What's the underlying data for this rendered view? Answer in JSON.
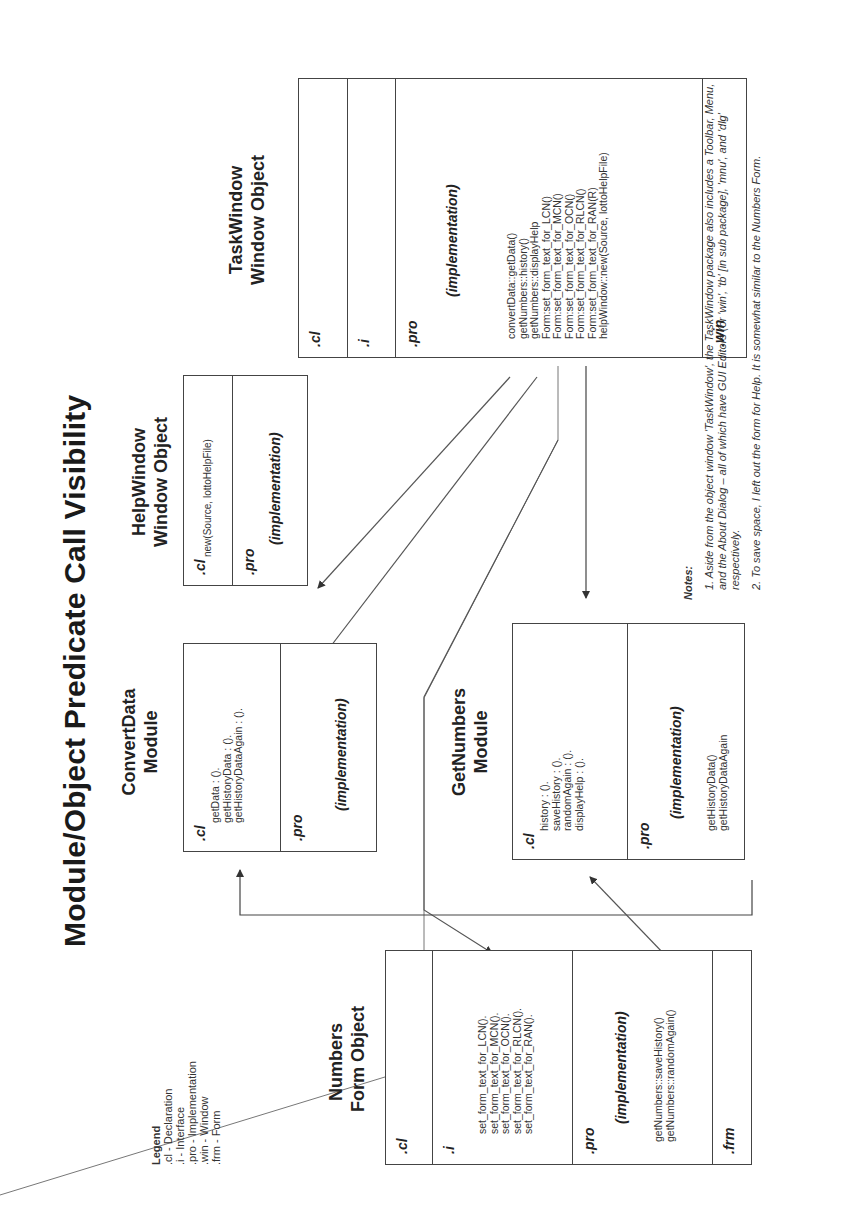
{
  "title": "Module/Object  Predicate Call Visibility",
  "legend": {
    "heading": "Legend",
    "items": [
      ".cl  - Declaration",
      ".i    - Interface",
      ".pro - Implementation",
      ".win - Window",
      ".frm - Form"
    ]
  },
  "boxes": {
    "task_window": {
      "title_line1": "TaskWindow",
      "title_line2": "Window Object",
      "sections": {
        "cl": ".cl",
        "i": ".i",
        "pro": ".pro",
        "win": ".win"
      },
      "impl_label": "(implementation)",
      "pro_lines": [
        "convertData::getData()",
        "getNumbers::history()",
        "getNumbers::displayHelp",
        "Form:set_form_text_for_LCN()",
        "Form:set_form_text_for_MCN()",
        "Form:set_form_text_for_OCN()",
        "Form:set_form_text_for_RLCN()",
        "Form:set_form_text_for_RAN(R)",
        "helpWindow::new(Source, lottoHelpFile)"
      ]
    },
    "help_window": {
      "title_line1": "HelpWindow",
      "title_line2": "Window Object",
      "sections": {
        "cl": ".cl",
        "pro": ".pro"
      },
      "cl_lines": [
        "new(Source, lottoHelpFile)"
      ],
      "impl_label": "(implementation)"
    },
    "convert_data": {
      "title_line1": "ConvertData",
      "title_line2": "Module",
      "sections": {
        "cl": ".cl",
        "pro": ".pro"
      },
      "cl_lines": [
        "getData : ().",
        "getHistoryData : ().",
        "getHistoryDataAgain : ()."
      ],
      "impl_label": "(implementation)"
    },
    "get_numbers": {
      "title_line1": "GetNumbers",
      "title_line2": "Module",
      "sections": {
        "cl": ".cl",
        "pro": ".pro"
      },
      "cl_lines": [
        "history : ().",
        "saveHistory : ().",
        "randomAgain : ().",
        "displayHelp : ()."
      ],
      "impl_label": "(implementation)",
      "pro_lines": [
        "getHistoryData()",
        "getHistoryDataAgain"
      ]
    },
    "numbers_form": {
      "title_line1": "Numbers",
      "title_line2": "Form Object",
      "sections": {
        "cl": ".cl",
        "i": ".i",
        "pro": ".pro",
        "frm": ".frm"
      },
      "i_lines": [
        "set_form_text_for_LCN().",
        "set_form_text_for_MCN().",
        "set_form_text_for_OCN().",
        "set_form_text_for_RLCN().",
        "set_form_text_for_RAN()."
      ],
      "impl_label": "(implementation)",
      "pro_lines": [
        "getNumbers::saveHistory()",
        "getNumbers::randomAgain()"
      ]
    }
  },
  "notes": {
    "heading": "Notes:",
    "items": [
      "1. Aside from the object window 'TaskWindow', the TaskWindow package also includes a Toolbar, Menu, and the About Dialog – all of which have GUI Editors (or 'win', 'tb' [in sub package], 'mnu', and 'dlg' respectively.",
      "2. To save space, I left out the form for Help. It is somewhat similar to the Numbers Form."
    ]
  }
}
